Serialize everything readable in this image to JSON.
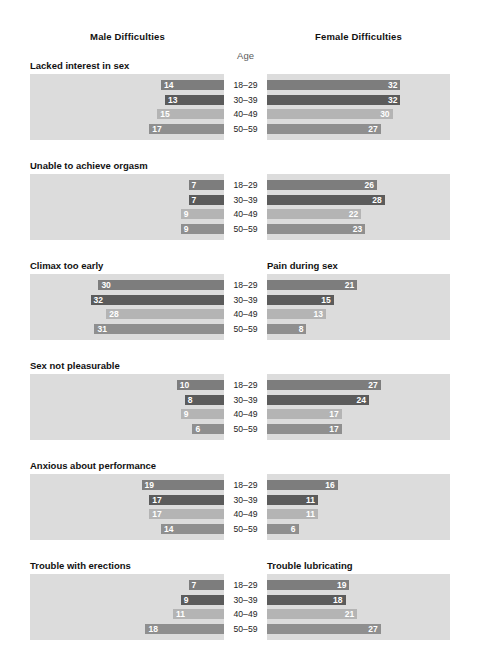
{
  "header": {
    "male_title": "Male Difficulties",
    "female_title": "Female Difficulties",
    "age_label": "Age"
  },
  "chart_data": {
    "type": "bar",
    "xlabel": "",
    "ylabel": "",
    "categories": [
      "18–29",
      "30–39",
      "40–49",
      "50–59"
    ],
    "value_unit": "percent",
    "xlim": [
      0,
      32
    ],
    "grid": false,
    "legend_position": "none",
    "orientation": "horizontal-diverging",
    "panel_titles": {
      "left": "Male Difficulties",
      "right": "Female Difficulties"
    },
    "row_colors": [
      "#7d7d7d",
      "#5b5b5b",
      "#b4b4b4",
      "#8f8f8f"
    ],
    "panel_background": "#dcdcdc",
    "sections": [
      {
        "male_title": "Lacked interest in sex",
        "female_title": "",
        "male_values": [
          14,
          13,
          15,
          17
        ],
        "female_values": [
          32,
          32,
          30,
          27
        ]
      },
      {
        "male_title": "Unable to achieve orgasm",
        "female_title": "",
        "male_values": [
          7,
          7,
          9,
          9
        ],
        "female_values": [
          26,
          28,
          22,
          23
        ]
      },
      {
        "male_title": "Climax too early",
        "female_title": "Pain during sex",
        "male_values": [
          30,
          32,
          28,
          31
        ],
        "female_values": [
          21,
          15,
          13,
          8
        ]
      },
      {
        "male_title": "Sex not pleasurable",
        "female_title": "",
        "male_values": [
          10,
          8,
          9,
          6
        ],
        "female_values": [
          27,
          24,
          17,
          17
        ]
      },
      {
        "male_title": "Anxious about performance",
        "female_title": "",
        "male_values": [
          19,
          17,
          17,
          14
        ],
        "female_values": [
          16,
          11,
          11,
          6
        ]
      },
      {
        "male_title": "Trouble with erections",
        "female_title": "Trouble lubricating",
        "male_values": [
          7,
          9,
          11,
          18
        ],
        "female_values": [
          19,
          18,
          21,
          27
        ]
      }
    ]
  }
}
